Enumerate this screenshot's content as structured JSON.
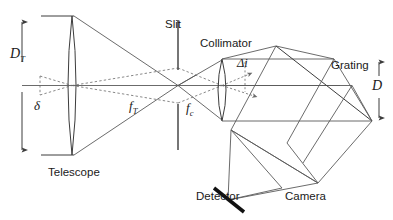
{
  "figure": {
    "type": "optical-ray-diagram",
    "width": 393,
    "height": 220,
    "background_color": "#ffffff",
    "line_color": "#3c3c3c",
    "text_color": "#1a1a1a"
  },
  "labels": {
    "telescope": "Telescope",
    "slit": "Slit",
    "collimator": "Collimator",
    "grating": "Grating",
    "camera": "Camera",
    "detector": "Detector"
  },
  "math_labels": {
    "telescope_aperture": "D",
    "telescope_aperture_sub": "T",
    "telescope_focal": "f",
    "telescope_focal_sub": "T",
    "collimator_focal": "f",
    "collimator_focal_sub": "c",
    "beam_diameter": "D",
    "angular_size": "δ",
    "incidence_change": "Δi"
  },
  "components": {
    "telescope": {
      "name": "telescope-lens",
      "shape": "biconvex-lens",
      "x": 72,
      "top_y": 16,
      "bottom_y": 155,
      "aperture_label": "D_T",
      "focal_label": "f_T"
    },
    "slit": {
      "name": "slit",
      "x": 178,
      "upper_segment": [
        20,
        70
      ],
      "lower_segment": [
        105,
        150
      ],
      "label": "Slit"
    },
    "collimator": {
      "name": "collimator-lens",
      "shape": "biconvex-lens",
      "x": 222,
      "top_y": 60,
      "bottom_y": 120,
      "focal_label": "f_c"
    },
    "grating": {
      "name": "diffraction-grating",
      "orientation": "diagonal",
      "beam_diameter_label": "D"
    },
    "camera": {
      "name": "camera-lens",
      "label": "Camera"
    },
    "detector": {
      "name": "detector",
      "shape": "thick-tilted-bar",
      "label": "Detector"
    }
  },
  "annotations": {
    "D_T_arrow": {
      "name": "telescope-aperture-dimension-arrow",
      "x": 22,
      "y_top": 18,
      "y_bottom": 152,
      "style": "double-headed-vertical"
    },
    "D_arrow": {
      "name": "beam-diameter-dimension-arrow",
      "x": 379,
      "y_top": 58,
      "y_bottom": 120,
      "style": "double-headed-vertical"
    },
    "delta_angle": {
      "name": "source-angular-size",
      "symbol": "δ",
      "x": 35,
      "y": 100
    },
    "delta_i_angle": {
      "name": "incidence-angle-change",
      "symbol": "Δi",
      "x": 243,
      "y": 66
    }
  },
  "ray_paths": {
    "solid_description": "marginal rays from telescope aperture converging through slit, collimated by collimator, dispersed at grating, focused by camera onto detector",
    "dashed_description": "chief rays from extended source of angular size delta"
  }
}
